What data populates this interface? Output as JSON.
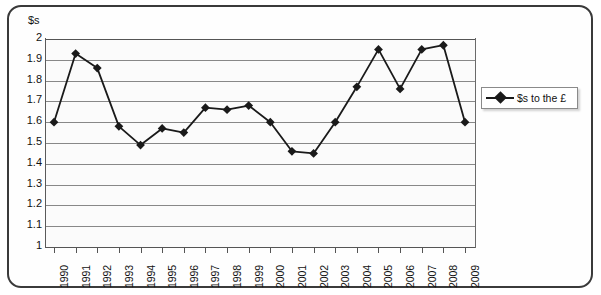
{
  "chart_data": {
    "type": "line",
    "title": "",
    "xlabel": "",
    "ylabel": "$s",
    "ylim": [
      1,
      2
    ],
    "ytick_step": 0.1,
    "grid": true,
    "legend_position": "right",
    "categories": [
      "1990",
      "1991",
      "1992",
      "1993",
      "1994",
      "1995",
      "1996",
      "1997",
      "1998",
      "1999",
      "2000",
      "2001",
      "2002",
      "2003",
      "2004",
      "2005",
      "2006",
      "2007",
      "2008",
      "2009"
    ],
    "series": [
      {
        "name": "$s to the £",
        "marker": "diamond",
        "color": "#1a1a1a",
        "values": [
          1.6,
          1.93,
          1.86,
          1.58,
          1.49,
          1.57,
          1.55,
          1.67,
          1.66,
          1.68,
          1.6,
          1.46,
          1.45,
          1.6,
          1.77,
          1.95,
          1.76,
          1.95,
          1.97,
          1.6
        ]
      }
    ],
    "ytick_labels": [
      "2",
      "1.9",
      "1.8",
      "1.7",
      "1.6",
      "1.5",
      "1.4",
      "1.3",
      "1.2",
      "1.1",
      "1"
    ],
    "ytick_values": [
      2,
      1.9,
      1.8,
      1.7,
      1.6,
      1.5,
      1.4,
      1.3,
      1.2,
      1.1,
      1
    ]
  },
  "axis": {
    "y_title": "$s"
  },
  "legend": {
    "items": [
      {
        "label": "$s to the £",
        "marker": "diamond-marker-icon"
      }
    ]
  }
}
